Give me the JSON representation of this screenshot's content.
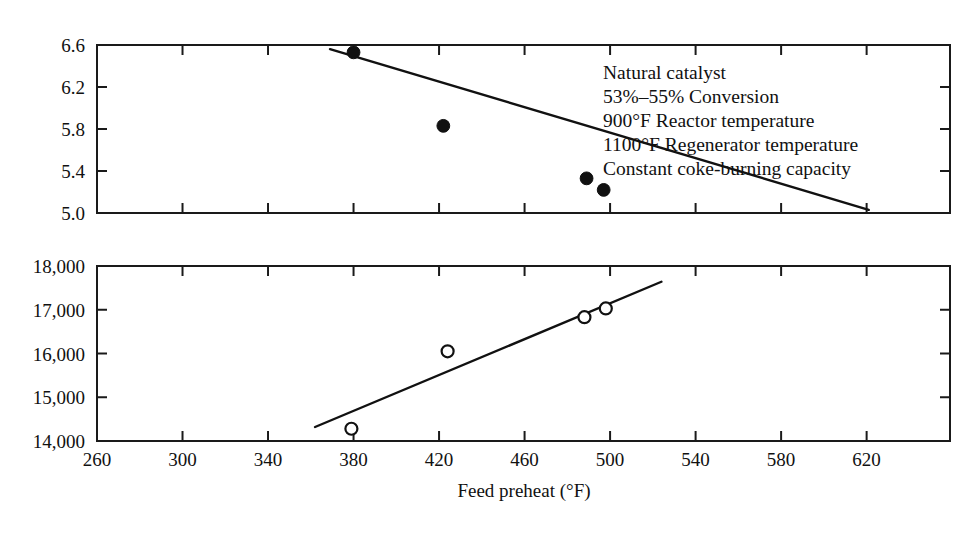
{
  "chart_data": {
    "type": "scatter",
    "title": "",
    "xlabel": "Feed preheat (°F)",
    "ylabel": "",
    "grid": false,
    "legend": "none",
    "panels": [
      {
        "name": "upper-panel",
        "ylabel": "",
        "ylim": [
          5.0,
          6.6
        ],
        "yticks": [
          5.0,
          5.4,
          5.8,
          6.2,
          6.6
        ],
        "ytick_labels": [
          "5.0",
          "5.4",
          "5.8",
          "6.2",
          "6.6"
        ],
        "xlim": [
          260,
          659
        ],
        "marker": "filled-circle",
        "x": [
          380,
          422,
          489,
          497
        ],
        "y": [
          6.53,
          5.83,
          5.33,
          5.22
        ],
        "trendline": {
          "x": [
            369,
            621
          ],
          "y": [
            6.56,
            5.03
          ]
        }
      },
      {
        "name": "lower-panel",
        "ylabel": "",
        "ylim": [
          14000,
          18000
        ],
        "yticks": [
          14000,
          15000,
          16000,
          17000,
          18000
        ],
        "ytick_labels": [
          "14,000",
          "15,000",
          "16,000",
          "17,000",
          "18,000"
        ],
        "xlim": [
          260,
          659
        ],
        "marker": "open-circle",
        "x": [
          379,
          424,
          488,
          498
        ],
        "y": [
          14280,
          16050,
          16830,
          17030
        ],
        "trendline": {
          "x": [
            362,
            524
          ],
          "y": [
            14320,
            17640
          ]
        }
      }
    ],
    "xticks": [
      260,
      300,
      340,
      380,
      420,
      460,
      500,
      540,
      580,
      620
    ],
    "xtick_labels": [
      "260",
      "300",
      "340",
      "380",
      "420",
      "460",
      "500",
      "540",
      "580",
      "620"
    ],
    "annotations": [
      "Natural catalyst",
      "53%–55% Conversion",
      "900°F Reactor temperature",
      "1100°F Regenerator temperature",
      "Constant coke-burning capacity"
    ]
  },
  "colors": {
    "ink": "#111111",
    "background": "#ffffff"
  }
}
